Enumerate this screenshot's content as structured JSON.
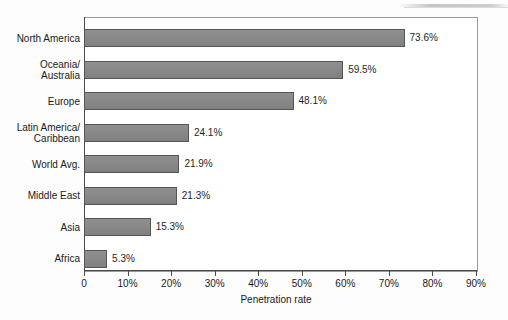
{
  "chart_data": {
    "type": "bar",
    "orientation": "horizontal",
    "title": "",
    "xlabel": "Penetration rate",
    "ylabel": "",
    "xlim": [
      0,
      90
    ],
    "xtick_values": [
      0,
      10,
      20,
      30,
      40,
      50,
      60,
      70,
      80,
      90
    ],
    "xtick_labels": [
      "0",
      "10%",
      "20%",
      "30%",
      "40%",
      "50%",
      "60%",
      "70%",
      "80%",
      "90%"
    ],
    "grid": false,
    "legend": null,
    "bar_color": "#878787",
    "bar_edge_color": "#555555",
    "categories": [
      "North America",
      "Oceania/\nAustralia",
      "Europe",
      "Latin America/\nCaribbean",
      "World Avg.",
      "Middle East",
      "Asia",
      "Africa"
    ],
    "values": [
      73.6,
      59.5,
      48.1,
      24.1,
      21.9,
      21.3,
      15.3,
      5.3
    ],
    "value_labels": [
      "73.6%",
      "59.5%",
      "48.1%",
      "24.1%",
      "21.9%",
      "21.3%",
      "15.3%",
      "5.3%"
    ]
  }
}
